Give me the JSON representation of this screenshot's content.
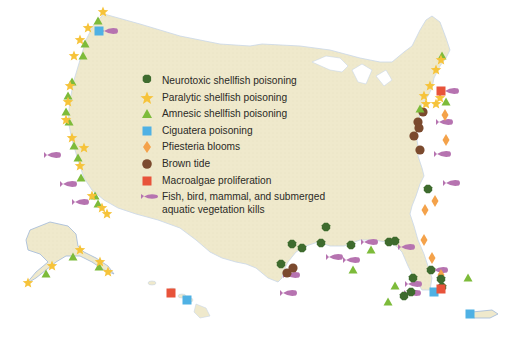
{
  "legend": {
    "items": [
      {
        "key": "neurotoxic",
        "label": "Neurotoxic shellfish poisoning",
        "symbol": "dark-green-octagon",
        "color": "#3e6b2e"
      },
      {
        "key": "paralytic",
        "label": "Paralytic shellfish poisoning",
        "symbol": "yellow-star",
        "color": "#f6c33a"
      },
      {
        "key": "amnesic",
        "label": "Amnesic shellfish poisoning",
        "symbol": "green-triangle",
        "color": "#7dbb3a"
      },
      {
        "key": "ciguatera",
        "label": "Ciguatera poisoning",
        "symbol": "blue-square",
        "color": "#4fb1e4"
      },
      {
        "key": "pfiesteria",
        "label": "Pfiesteria blooms",
        "symbol": "orange-diamond",
        "color": "#f4a24a"
      },
      {
        "key": "brown_tide",
        "label": "Brown tide",
        "symbol": "brown-circle",
        "color": "#7b4a2e"
      },
      {
        "key": "macroalgae",
        "label": "Macroalgae proliferation",
        "symbol": "red-square",
        "color": "#e8533a"
      },
      {
        "key": "kills",
        "label": "Fish, bird, mammal, and submerged aquatic vegetation kills",
        "symbol": "purple-fish",
        "color": "#b673b0"
      }
    ]
  },
  "map": {
    "land_color": "#efe9cc",
    "coast_color": "#9fb7d8",
    "regions": [
      "contiguous-us",
      "alaska",
      "hawaii",
      "puerto-rico"
    ]
  },
  "markers": {
    "paralytic": [
      [
        103,
        12
      ],
      [
        88,
        28
      ],
      [
        80,
        40
      ],
      [
        74,
        56
      ],
      [
        70,
        86
      ],
      [
        68,
        102
      ],
      [
        66,
        120
      ],
      [
        72,
        138
      ],
      [
        80,
        166
      ],
      [
        92,
        196
      ],
      [
        102,
        208
      ],
      [
        107,
        214
      ],
      [
        441,
        60
      ],
      [
        436,
        70
      ],
      [
        430,
        86
      ],
      [
        424,
        96
      ],
      [
        440,
        98
      ],
      [
        436,
        104
      ],
      [
        426,
        104
      ],
      [
        84,
        148
      ],
      [
        28,
        283
      ],
      [
        52,
        266
      ],
      [
        80,
        250
      ],
      [
        100,
        262
      ],
      [
        108,
        272
      ]
    ],
    "amnesic": [
      [
        98,
        21
      ],
      [
        85,
        44
      ],
      [
        83,
        56
      ],
      [
        72,
        82
      ],
      [
        68,
        96
      ],
      [
        66,
        112
      ],
      [
        69,
        122
      ],
      [
        74,
        146
      ],
      [
        78,
        158
      ],
      [
        81,
        178
      ],
      [
        95,
        196
      ],
      [
        98,
        204
      ],
      [
        73,
        257
      ],
      [
        46,
        274
      ],
      [
        99,
        267
      ],
      [
        442,
        56
      ],
      [
        446,
        102
      ],
      [
        420,
        109
      ],
      [
        371,
        250
      ],
      [
        353,
        270
      ],
      [
        395,
        286
      ],
      [
        468,
        278
      ],
      [
        388,
        302
      ]
    ],
    "ciguatera": [
      [
        99,
        31
      ],
      [
        434,
        292
      ],
      [
        187,
        300
      ],
      [
        470,
        314
      ]
    ],
    "neurotoxic": [
      [
        292,
        244
      ],
      [
        281,
        264
      ],
      [
        302,
        248
      ],
      [
        321,
        243
      ],
      [
        326,
        227
      ],
      [
        351,
        245
      ],
      [
        389,
        242
      ],
      [
        411,
        292
      ],
      [
        442,
        287
      ],
      [
        413,
        278
      ],
      [
        404,
        296
      ],
      [
        441,
        279
      ],
      [
        431,
        270
      ],
      [
        428,
        189
      ],
      [
        395,
        241
      ]
    ],
    "pfiesteria": [
      [
        445,
        115
      ],
      [
        446,
        140
      ],
      [
        435,
        201
      ],
      [
        425,
        210
      ],
      [
        424,
        240
      ],
      [
        432,
        258
      ],
      [
        441,
        275
      ]
    ],
    "brown_tide": [
      [
        423,
        112
      ],
      [
        418,
        122
      ],
      [
        419,
        128
      ],
      [
        414,
        136
      ],
      [
        420,
        150
      ],
      [
        287,
        273
      ],
      [
        293,
        268
      ]
    ],
    "macroalgae": [
      [
        441,
        91
      ],
      [
        441,
        289
      ],
      [
        171,
        293
      ]
    ],
    "kills": [
      [
        110,
        31
      ],
      [
        53,
        155
      ],
      [
        69,
        184
      ],
      [
        81,
        202
      ],
      [
        451,
        91
      ],
      [
        445,
        122
      ],
      [
        443,
        154
      ],
      [
        452,
        183
      ],
      [
        292,
        275
      ],
      [
        289,
        293
      ],
      [
        352,
        260
      ],
      [
        335,
        257
      ],
      [
        370,
        242
      ],
      [
        407,
        247
      ],
      [
        440,
        270
      ],
      [
        414,
        284
      ],
      [
        413,
        293
      ]
    ]
  }
}
